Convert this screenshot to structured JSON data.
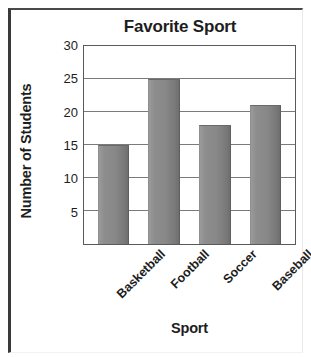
{
  "chart_data": {
    "type": "bar",
    "title": "Favorite Sport",
    "xlabel": "Sport",
    "ylabel": "Number of Students",
    "categories": [
      "Basketball",
      "Football",
      "Soccer",
      "Baseball"
    ],
    "values": [
      15,
      25,
      18,
      21
    ],
    "ylim": [
      0,
      30
    ],
    "yticks": [
      5,
      10,
      15,
      20,
      25,
      30
    ],
    "ytick_labels": [
      "5",
      "10",
      "15",
      "20",
      "25",
      "30"
    ],
    "grid": true,
    "legend": false,
    "xtick_rotation": -45,
    "colors": {
      "bar_fill": "#888888",
      "bar_edge": "#6a6a6a",
      "gridline": "#7a7a7a",
      "axis": "#5a5a5a",
      "text": "#1d1d1d",
      "frame": "#3a3a3a",
      "background": "#ffffff"
    }
  }
}
